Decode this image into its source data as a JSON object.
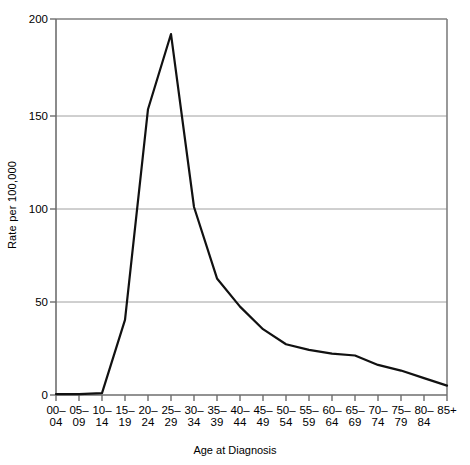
{
  "chart_data": {
    "type": "line",
    "title": "",
    "xlabel": "Age at Diagnosis",
    "ylabel": "Rate per 100,000",
    "categories": [
      "00–04",
      "05–09",
      "10–14",
      "15–19",
      "20–24",
      "25–29",
      "30–34",
      "35–39",
      "40–44",
      "45–49",
      "50–54",
      "55–59",
      "60–64",
      "65–69",
      "70–74",
      "75–79",
      "80–84",
      "85+"
    ],
    "values": [
      0.5,
      0.5,
      1,
      40,
      152,
      192,
      100,
      62,
      47,
      35,
      27,
      24,
      22,
      21,
      16,
      13,
      9,
      5
    ],
    "ylim": [
      0,
      200
    ],
    "yticks": [
      0,
      50,
      100,
      150,
      200
    ],
    "ytick_labels": [
      "0",
      "50",
      "100",
      "150",
      "200"
    ],
    "grid": true,
    "grid_color": "#999999",
    "legend": "none",
    "line_color": "#000000",
    "line_width": 2.2,
    "axis_color": "#808080",
    "background": "#ffffff"
  },
  "axes": {
    "y_axis_title": "Rate per 100,000",
    "x_axis_title": "Age at Diagnosis"
  }
}
